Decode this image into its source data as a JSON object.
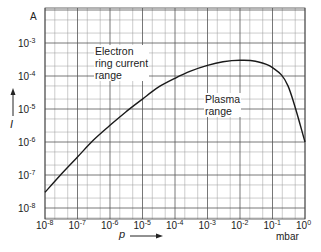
{
  "chart_data": {
    "type": "line",
    "title": "",
    "xlabel": "p",
    "xunit": "mbar",
    "ylabel": "I",
    "yunit": "A",
    "xscale": "log",
    "yscale": "log",
    "xlim": [
      1e-08,
      1
    ],
    "ylim": [
      1e-08,
      0.003
    ],
    "grid": true,
    "legend": "none",
    "x_ticks": [
      "10^-8",
      "10^-7",
      "10^-6",
      "10^-5",
      "10^-4",
      "10^-3",
      "10^-2",
      "10^-1",
      "10^0"
    ],
    "y_ticks": [
      "10^-8",
      "10^-7",
      "10^-6",
      "10^-5",
      "10^-4",
      "10^-3"
    ],
    "annotations": [
      {
        "text": "Electron ring current range",
        "lines": [
          "Electron",
          "ring current",
          "range"
        ]
      },
      {
        "text": "Plasma range",
        "lines": [
          "Plasma",
          "range"
        ]
      }
    ],
    "series": [
      {
        "name": "Ion current I vs pressure p",
        "x": [
          1e-08,
          3e-08,
          1e-07,
          3e-07,
          1e-06,
          3e-06,
          1e-05,
          3e-05,
          0.0001,
          0.0003,
          0.001,
          0.003,
          0.01,
          0.03,
          0.1,
          0.3,
          1
        ],
        "y": [
          3e-08,
          1e-07,
          3.5e-07,
          1.1e-06,
          3.2e-06,
          8e-06,
          2e-05,
          4.5e-05,
          8.5e-05,
          0.00014,
          0.00021,
          0.00027,
          0.0003,
          0.00028,
          0.00018,
          5e-05,
          1e-06
        ]
      }
    ]
  },
  "axes": {
    "y_unit_label": "A",
    "x_unit_label": "mbar",
    "y_axis_label": "I",
    "x_axis_label": "p",
    "y_tick_mantissa": "10",
    "y_tick_exponents": [
      "-3",
      "-4",
      "-5",
      "-6",
      "-7",
      "-8"
    ],
    "x_tick_exponents": [
      "-8",
      "-7",
      "-6",
      "-5",
      "-4",
      "-3",
      "-2",
      "-1",
      "0"
    ]
  },
  "annotations": {
    "electron": [
      "Electron",
      "ring current",
      "range"
    ],
    "plasma": [
      "Plasma",
      "range"
    ]
  }
}
